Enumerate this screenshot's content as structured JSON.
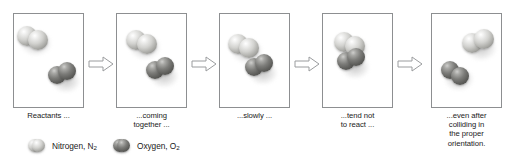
{
  "figure": {
    "type": "reaction-sequence-diagram",
    "panels": [
      {
        "caption": "Reactants ...",
        "molecules": [
          {
            "species": "nitrogen",
            "formula": "N2",
            "position": "upper-left"
          },
          {
            "species": "oxygen",
            "formula": "O2",
            "position": "lower-right"
          }
        ]
      },
      {
        "caption": "...coming together ...",
        "caption_lines": [
          "...coming",
          "together ..."
        ],
        "molecules": [
          {
            "species": "nitrogen",
            "formula": "N2",
            "position": "upper-left"
          },
          {
            "species": "oxygen",
            "formula": "O2",
            "position": "lower-right"
          }
        ]
      },
      {
        "caption": "...slowly ...",
        "caption_lines": [
          "...slowly ..."
        ],
        "molecules": [
          {
            "species": "nitrogen",
            "formula": "N2",
            "position": "upper-left"
          },
          {
            "species": "oxygen",
            "formula": "O2",
            "position": "center-right"
          }
        ]
      },
      {
        "caption": "...tend not to react ...",
        "caption_lines": [
          "...tend not",
          "to react ..."
        ],
        "molecules": [
          {
            "species": "nitrogen",
            "formula": "N2",
            "position": "upper-left"
          },
          {
            "species": "oxygen",
            "formula": "O2",
            "position": "center"
          }
        ]
      },
      {
        "caption": "...even after colliding in the proper orientation.",
        "caption_lines": [
          "...even after",
          "colliding in",
          "the proper",
          "orientation."
        ],
        "molecules": [
          {
            "species": "nitrogen",
            "formula": "N2",
            "position": "upper-right"
          },
          {
            "species": "oxygen",
            "formula": "O2",
            "position": "lower-left"
          }
        ]
      }
    ],
    "arrows": [
      {
        "name": "arrow-1",
        "direction": "right"
      },
      {
        "name": "arrow-2",
        "direction": "right"
      },
      {
        "name": "arrow-3",
        "direction": "right"
      },
      {
        "name": "arrow-4",
        "direction": "right"
      }
    ],
    "legend": {
      "items": [
        {
          "name": "nitrogen",
          "label_text": "Nitrogen, N",
          "subscript": "2",
          "color": "#b4b4b1"
        },
        {
          "name": "oxygen",
          "label_text": "Oxygen, O",
          "subscript": "2",
          "color": "#6e6e6b"
        }
      ]
    },
    "colors": {
      "frame_border": "#8d8f91",
      "background": "#ffffff",
      "text": "#1a1a1a",
      "arrow_outline": "#9a9c9e"
    }
  }
}
